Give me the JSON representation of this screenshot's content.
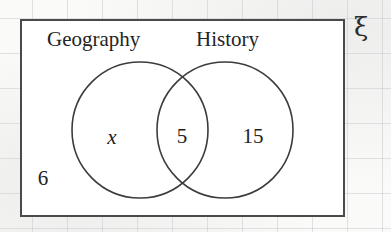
{
  "diagram": {
    "type": "venn-two-set",
    "universal_symbol": "ξ",
    "sets": [
      {
        "key": "geography",
        "label": "Geography"
      },
      {
        "key": "history",
        "label": "History"
      }
    ],
    "regions": [
      {
        "key": "geography_only",
        "value": "x",
        "description": "Geography only"
      },
      {
        "key": "intersection",
        "value": "5",
        "description": "Geography and History"
      },
      {
        "key": "history_only",
        "value": "15",
        "description": "History only"
      },
      {
        "key": "outside",
        "value": "6",
        "description": "Neither Geography nor History"
      }
    ],
    "geometry": {
      "rect": {
        "x": 20,
        "y": 19,
        "width": 325,
        "height": 198
      },
      "left_circle": {
        "cx": 140,
        "cy": 130,
        "r": 68
      },
      "right_circle": {
        "cx": 225,
        "cy": 130,
        "r": 68
      }
    },
    "colors": {
      "rect_stroke": "#4a4a4a",
      "circle_stroke": "#3c3c3c",
      "text": "#222222",
      "paper": "#fafaf9",
      "grid": "#a0a5ac"
    }
  }
}
